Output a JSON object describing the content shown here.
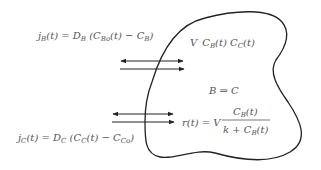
{
  "diagram": {
    "stroke_color": "#222222",
    "text_color": "#555555",
    "background": "#ffffff",
    "equations": {
      "flux_b": {
        "lhs": "j",
        "lhs_sub": "B",
        "lhs_arg": "(t) = D",
        "d_sub": "B",
        "mid": " (C",
        "c1_sub": "Bo",
        "mid2": "(t) − C",
        "c2_sub": "B",
        "end": ")"
      },
      "flux_c": {
        "lhs": "j",
        "lhs_sub": "C",
        "lhs_arg": "(t) = D",
        "d_sub": "C",
        "mid": " (C",
        "c1_sub": "C",
        "mid2": "(t) − C",
        "c2_sub": "Co",
        "end": ")"
      },
      "volume_state": {
        "v": "V",
        "c1": "C",
        "c1_sub": "B",
        "c1_arg": "(t) C",
        "c2_sub": "C",
        "c2_arg": "(t)"
      },
      "reaction": {
        "text": "B ⇒ C"
      },
      "rate": {
        "lhs": "r(t) = V",
        "numerator": "C",
        "num_sub": "B",
        "num_arg": "(t)",
        "denominator_prefix": "k + C",
        "den_sub": "B",
        "den_arg": "(t)"
      }
    },
    "arrows": [
      {
        "name": "flux-b-exchange",
        "type": "double-headed"
      },
      {
        "name": "flux-b-inflow",
        "type": "right"
      },
      {
        "name": "flux-c-exchange",
        "type": "double-headed"
      },
      {
        "name": "flux-c-outflow",
        "type": "right"
      }
    ]
  }
}
